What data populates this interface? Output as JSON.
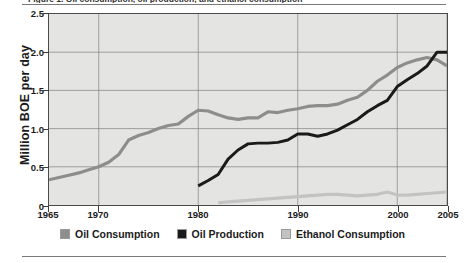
{
  "figure": {
    "caption_sliver": "Figure 1. Oil consumption, oil production, and ethanol consumption",
    "top_rule": "horizontal-rule",
    "bottom_rule": "horizontal-rule"
  },
  "legend": {
    "position": "bottom-center",
    "items": [
      {
        "label": "Oil Consumption",
        "color": "#8d8d8d",
        "name": "legend-item-oil-consumption"
      },
      {
        "label": "Oil Production",
        "color": "#1a1a1a",
        "name": "legend-item-oil-production"
      },
      {
        "label": "Ethanol Consumption",
        "color": "#c3c3c3",
        "name": "legend-item-ethanol-consumption"
      }
    ]
  },
  "chart_data": {
    "type": "line",
    "title": "",
    "xlabel": "",
    "ylabel": "Million BOE per day",
    "xlim": [
      1965,
      2005
    ],
    "ylim": [
      0,
      2.5
    ],
    "grid": true,
    "plot_background": "#e4e4e3",
    "xticks": [
      1965,
      1970,
      1980,
      1990,
      2000,
      2005
    ],
    "xtick_labels": [
      "1965",
      "1970",
      "1980",
      "1990",
      "2000",
      "2005"
    ],
    "yticks": [
      0,
      0.5,
      1.0,
      1.5,
      2.0,
      2.5
    ],
    "ytick_labels": [
      "0",
      "0.5",
      "1.0",
      "1.5",
      "2.0",
      "2.5"
    ],
    "x_gridlines": [
      1970,
      1980,
      1990,
      2000,
      2005
    ],
    "y_gridlines": [
      0.5,
      1.0,
      1.5,
      2.0
    ],
    "series": [
      {
        "name": "Oil Consumption",
        "color": "#8d8d8d",
        "width": 3.2,
        "x": [
          1965,
          1966,
          1967,
          1968,
          1969,
          1970,
          1971,
          1972,
          1973,
          1974,
          1975,
          1976,
          1977,
          1978,
          1979,
          1980,
          1981,
          1982,
          1983,
          1984,
          1985,
          1986,
          1987,
          1988,
          1989,
          1990,
          1991,
          1992,
          1993,
          1994,
          1995,
          1996,
          1997,
          1998,
          1999,
          2000,
          2001,
          2002,
          2003,
          2004,
          2005
        ],
        "y": [
          0.33,
          0.36,
          0.39,
          0.42,
          0.46,
          0.5,
          0.56,
          0.66,
          0.85,
          0.91,
          0.95,
          1.0,
          1.04,
          1.06,
          1.16,
          1.24,
          1.23,
          1.18,
          1.14,
          1.12,
          1.14,
          1.14,
          1.22,
          1.21,
          1.24,
          1.26,
          1.29,
          1.3,
          1.3,
          1.32,
          1.37,
          1.41,
          1.5,
          1.62,
          1.7,
          1.8,
          1.86,
          1.9,
          1.93,
          1.9,
          1.82
        ]
      },
      {
        "name": "Oil Production",
        "color": "#1a1a1a",
        "width": 3.0,
        "x": [
          1980,
          1981,
          1982,
          1983,
          1984,
          1985,
          1986,
          1987,
          1988,
          1989,
          1990,
          1991,
          1992,
          1993,
          1994,
          1995,
          1996,
          1997,
          1998,
          1999,
          2000,
          2001,
          2002,
          2003,
          2004,
          2005
        ],
        "y": [
          0.25,
          0.32,
          0.4,
          0.6,
          0.72,
          0.8,
          0.81,
          0.81,
          0.82,
          0.85,
          0.93,
          0.93,
          0.9,
          0.93,
          0.98,
          1.05,
          1.12,
          1.22,
          1.3,
          1.37,
          1.55,
          1.64,
          1.72,
          1.82,
          2.0,
          2.0
        ]
      },
      {
        "name": "Ethanol Consumption",
        "color": "#c3c3c3",
        "width": 3.2,
        "x": [
          1982,
          1983,
          1984,
          1985,
          1986,
          1987,
          1988,
          1989,
          1990,
          1991,
          1992,
          1993,
          1994,
          1995,
          1996,
          1997,
          1998,
          1999,
          2000,
          2001,
          2002,
          2003,
          2004,
          2005
        ],
        "y": [
          0.03,
          0.04,
          0.05,
          0.06,
          0.07,
          0.08,
          0.09,
          0.1,
          0.11,
          0.12,
          0.13,
          0.14,
          0.14,
          0.13,
          0.12,
          0.13,
          0.14,
          0.17,
          0.13,
          0.13,
          0.14,
          0.15,
          0.16,
          0.17
        ]
      }
    ]
  }
}
